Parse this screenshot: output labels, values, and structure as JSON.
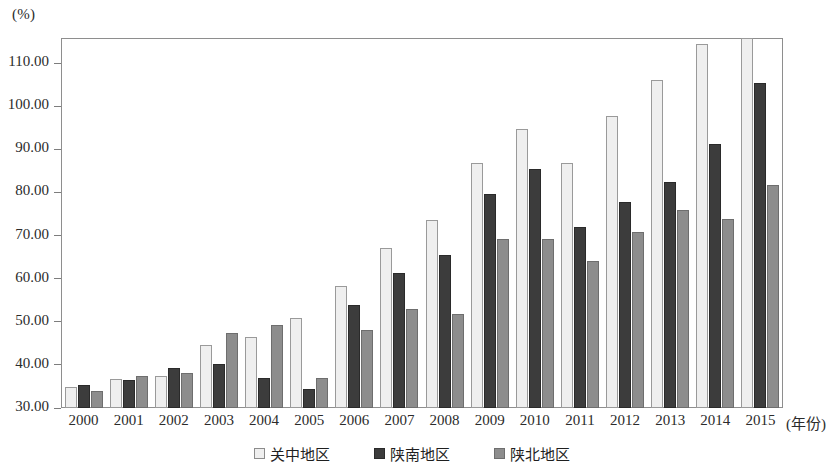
{
  "chart_data": {
    "type": "bar",
    "title": "",
    "subtitle": "",
    "unit_label": "(%)",
    "xlabel": "(年份)",
    "ylabel": "",
    "grid": false,
    "legend_position": "bottom-center",
    "ylim": [
      30.0,
      115.8
    ],
    "y_ticks": [
      "30.00",
      "40.00",
      "50.00",
      "60.00",
      "70.00",
      "80.00",
      "90.00",
      "100.00",
      "110.00"
    ],
    "y_tick_values": [
      30,
      40,
      50,
      60,
      70,
      80,
      90,
      100,
      110
    ],
    "categories": [
      "2000",
      "2001",
      "2002",
      "2003",
      "2004",
      "2005",
      "2006",
      "2007",
      "2008",
      "2009",
      "2010",
      "2011",
      "2012",
      "2013",
      "2014",
      "2015"
    ],
    "series": [
      {
        "name": "关中地区",
        "color": "#efefef",
        "values": [
          34.8,
          36.8,
          37.4,
          44.5,
          46.4,
          50.8,
          58.4,
          67.0,
          73.6,
          86.8,
          94.7,
          86.9,
          97.7,
          106.1,
          114.4,
          115.8
        ]
      },
      {
        "name": "陕南地区",
        "color": "#3c3c3c",
        "values": [
          35.4,
          36.6,
          39.3,
          40.2,
          37.0,
          34.4,
          54.0,
          61.3,
          65.5,
          79.7,
          85.5,
          72.0,
          77.8,
          82.4,
          91.3,
          105.3
        ]
      },
      {
        "name": "陕北地区",
        "color": "#8d8d8d",
        "values": [
          34.0,
          37.4,
          38.2,
          47.5,
          49.3,
          37.0,
          48.0,
          53.0,
          51.9,
          69.2,
          69.1,
          64.2,
          70.9,
          75.9,
          73.8,
          81.6
        ]
      }
    ]
  }
}
